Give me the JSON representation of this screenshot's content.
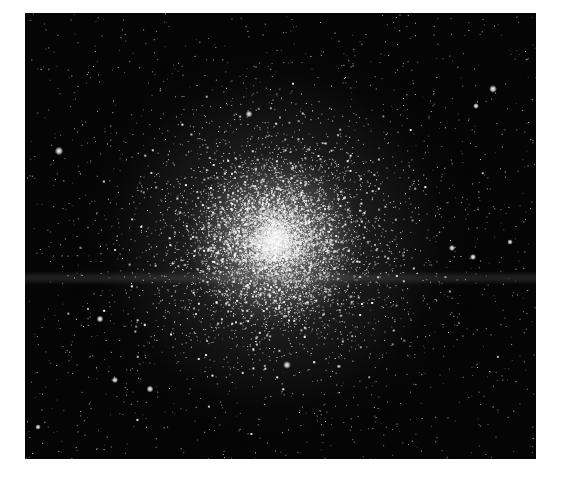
{
  "image": {
    "subject": "globular star cluster",
    "background_color": "#ffffff",
    "sky_color": "#050505",
    "frame": {
      "x": 25,
      "y": 13,
      "width": 511,
      "height": 446
    }
  },
  "cluster": {
    "center": {
      "x": 250,
      "y": 228
    },
    "core_radius": 40,
    "halo_radius": 210,
    "core_color": "#ffffff",
    "glow_color": "#c8c8c8",
    "star_count": 9000,
    "field_star_count": 1400
  },
  "band": {
    "y": 258,
    "height": 14,
    "color": "rgba(120,120,120,0.22)"
  },
  "bright_stars": [
    {
      "x": 34,
      "y": 138,
      "r": 2.2
    },
    {
      "x": 224,
      "y": 101,
      "r": 1.8
    },
    {
      "x": 468,
      "y": 76,
      "r": 2.0
    },
    {
      "x": 262,
      "y": 352,
      "r": 2.0
    },
    {
      "x": 75,
      "y": 306,
      "r": 1.8
    },
    {
      "x": 125,
      "y": 376,
      "r": 1.8
    },
    {
      "x": 90,
      "y": 367,
      "r": 1.6
    },
    {
      "x": 427,
      "y": 235,
      "r": 1.6
    },
    {
      "x": 448,
      "y": 244,
      "r": 1.6
    },
    {
      "x": 451,
      "y": 93,
      "r": 1.5
    },
    {
      "x": 485,
      "y": 229,
      "r": 1.4
    },
    {
      "x": 13,
      "y": 414,
      "r": 1.4
    }
  ],
  "seed": 42
}
